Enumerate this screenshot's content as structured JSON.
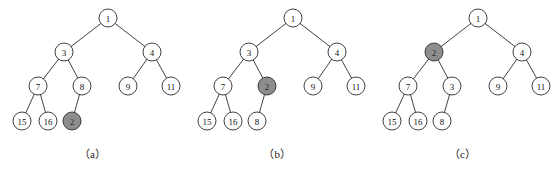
{
  "figure": {
    "background_color": "#ffffff",
    "node_fill_plain": "#ffffff",
    "node_fill_highlight": "#8d8d8d",
    "stroke_color": "#2b2b2b",
    "node_radius": 9
  },
  "panels": [
    {
      "id": "a",
      "caption": "（a）",
      "nodes": [
        {
          "key": "n1",
          "label": "1",
          "x": 108,
          "y": 18,
          "highlight": false
        },
        {
          "key": "n3",
          "label": "3",
          "x": 64,
          "y": 52,
          "highlight": false
        },
        {
          "key": "n4",
          "label": "4",
          "x": 152,
          "y": 52,
          "highlight": false
        },
        {
          "key": "n7",
          "label": "7",
          "x": 38,
          "y": 86,
          "highlight": false
        },
        {
          "key": "n8",
          "label": "8",
          "x": 82,
          "y": 86,
          "highlight": false
        },
        {
          "key": "n9",
          "label": "9",
          "x": 128,
          "y": 86,
          "highlight": false
        },
        {
          "key": "n11",
          "label": "11",
          "x": 171,
          "y": 86,
          "highlight": false
        },
        {
          "key": "n15",
          "label": "15",
          "x": 22,
          "y": 121,
          "highlight": false
        },
        {
          "key": "n16",
          "label": "16",
          "x": 48,
          "y": 121,
          "highlight": false
        },
        {
          "key": "n2",
          "label": "2",
          "x": 72,
          "y": 121,
          "highlight": true
        }
      ],
      "edges": [
        [
          "n1",
          "n3"
        ],
        [
          "n1",
          "n4"
        ],
        [
          "n3",
          "n7"
        ],
        [
          "n3",
          "n8"
        ],
        [
          "n4",
          "n9"
        ],
        [
          "n4",
          "n11"
        ],
        [
          "n7",
          "n15"
        ],
        [
          "n7",
          "n16"
        ],
        [
          "n8",
          "n2"
        ]
      ]
    },
    {
      "id": "b",
      "caption": "（b）",
      "nodes": [
        {
          "key": "n1",
          "label": "1",
          "x": 108,
          "y": 18,
          "highlight": false
        },
        {
          "key": "n3",
          "label": "3",
          "x": 64,
          "y": 52,
          "highlight": false
        },
        {
          "key": "n4",
          "label": "4",
          "x": 152,
          "y": 52,
          "highlight": false
        },
        {
          "key": "n7",
          "label": "7",
          "x": 38,
          "y": 86,
          "highlight": false
        },
        {
          "key": "n2",
          "label": "2",
          "x": 82,
          "y": 86,
          "highlight": true
        },
        {
          "key": "n9",
          "label": "9",
          "x": 128,
          "y": 86,
          "highlight": false
        },
        {
          "key": "n11",
          "label": "11",
          "x": 171,
          "y": 86,
          "highlight": false
        },
        {
          "key": "n15",
          "label": "15",
          "x": 22,
          "y": 121,
          "highlight": false
        },
        {
          "key": "n16",
          "label": "16",
          "x": 48,
          "y": 121,
          "highlight": false
        },
        {
          "key": "n8",
          "label": "8",
          "x": 72,
          "y": 121,
          "highlight": false
        }
      ],
      "edges": [
        [
          "n1",
          "n3"
        ],
        [
          "n1",
          "n4"
        ],
        [
          "n3",
          "n7"
        ],
        [
          "n3",
          "n2"
        ],
        [
          "n4",
          "n9"
        ],
        [
          "n4",
          "n11"
        ],
        [
          "n7",
          "n15"
        ],
        [
          "n7",
          "n16"
        ],
        [
          "n2",
          "n8"
        ]
      ]
    },
    {
      "id": "c",
      "caption": "（c）",
      "nodes": [
        {
          "key": "n1",
          "label": "1",
          "x": 108,
          "y": 18,
          "highlight": false
        },
        {
          "key": "n2",
          "label": "2",
          "x": 64,
          "y": 52,
          "highlight": true
        },
        {
          "key": "n4",
          "label": "4",
          "x": 152,
          "y": 52,
          "highlight": false
        },
        {
          "key": "n7",
          "label": "7",
          "x": 38,
          "y": 86,
          "highlight": false
        },
        {
          "key": "n3",
          "label": "3",
          "x": 82,
          "y": 86,
          "highlight": false
        },
        {
          "key": "n9",
          "label": "9",
          "x": 128,
          "y": 86,
          "highlight": false
        },
        {
          "key": "n11",
          "label": "11",
          "x": 171,
          "y": 86,
          "highlight": false
        },
        {
          "key": "n15",
          "label": "15",
          "x": 22,
          "y": 121,
          "highlight": false
        },
        {
          "key": "n16",
          "label": "16",
          "x": 48,
          "y": 121,
          "highlight": false
        },
        {
          "key": "n8",
          "label": "8",
          "x": 72,
          "y": 121,
          "highlight": false
        }
      ],
      "edges": [
        [
          "n1",
          "n2"
        ],
        [
          "n1",
          "n4"
        ],
        [
          "n2",
          "n7"
        ],
        [
          "n2",
          "n3"
        ],
        [
          "n4",
          "n9"
        ],
        [
          "n4",
          "n11"
        ],
        [
          "n7",
          "n15"
        ],
        [
          "n7",
          "n16"
        ],
        [
          "n3",
          "n8"
        ]
      ]
    }
  ]
}
